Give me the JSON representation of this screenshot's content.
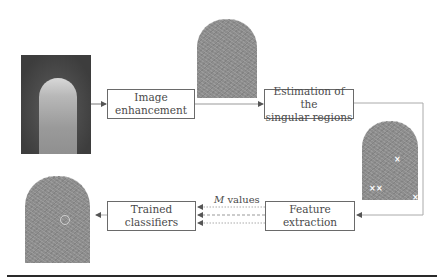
{
  "diagram": {
    "type": "flowchart",
    "nodes": [
      {
        "id": "input_photo",
        "kind": "image",
        "depicts": "photograph of a fingertip"
      },
      {
        "id": "image_enhancement",
        "kind": "process",
        "label": "Image\nenhancement"
      },
      {
        "id": "enhanced_print",
        "kind": "image",
        "depicts": "enhanced fingerprint"
      },
      {
        "id": "estimation",
        "kind": "process",
        "label": "Estimation of the\nsingular regions"
      },
      {
        "id": "singular_print",
        "kind": "image",
        "depicts": "fingerprint with singular region markers (x)"
      },
      {
        "id": "feature_extraction",
        "kind": "process",
        "label": "Feature\nextraction"
      },
      {
        "id": "trained_classifiers",
        "kind": "process",
        "label": "Trained\nclassifiers"
      },
      {
        "id": "result_print",
        "kind": "image",
        "depicts": "fingerprint with detected point circled"
      }
    ],
    "edges": [
      {
        "from": "input_photo",
        "to": "image_enhancement",
        "style": "solid"
      },
      {
        "from": "image_enhancement",
        "to": "estimation",
        "style": "solid"
      },
      {
        "from": "estimation",
        "to": "feature_extraction",
        "style": "solid"
      },
      {
        "from": "feature_extraction",
        "to": "trained_classifiers",
        "style": "dashed",
        "count": 3,
        "label": "M values"
      },
      {
        "from": "trained_classifiers",
        "to": "result_print",
        "style": "solid"
      }
    ],
    "edge_label": {
      "italic": "M",
      "rest": " values"
    },
    "markers": {
      "x_symbol": "×",
      "x_count": 4,
      "circle_count": 1
    }
  }
}
